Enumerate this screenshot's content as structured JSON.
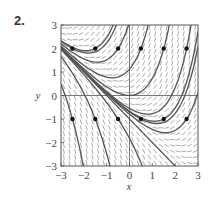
{
  "problem_number": "2.",
  "chart_data": {
    "type": "line",
    "subtype": "slope-field",
    "title": "",
    "xlabel": "x",
    "ylabel": "y",
    "xlim": [
      -3,
      3
    ],
    "ylim": [
      -3,
      3
    ],
    "xticks": [
      -3,
      -2,
      -1,
      0,
      1,
      2,
      3
    ],
    "yticks": [
      -3,
      -2,
      -1,
      0,
      1,
      2,
      3
    ],
    "xtick_labels": [
      "−3",
      "−2",
      "−1",
      "0",
      "1",
      "2",
      "3"
    ],
    "ytick_labels": [
      "−3",
      "−2",
      "−1",
      "0",
      "1",
      "2",
      "3"
    ],
    "grid": false,
    "slope_function": "x + y",
    "solution_family": "y = C e^x - x - 1",
    "initial_points": [
      {
        "x": -2.5,
        "y": 2
      },
      {
        "x": -1.5,
        "y": 2
      },
      {
        "x": -0.5,
        "y": 2
      },
      {
        "x": 0.5,
        "y": 2
      },
      {
        "x": 1.5,
        "y": 2
      },
      {
        "x": 2.5,
        "y": 2
      },
      {
        "x": -2.5,
        "y": -1
      },
      {
        "x": -1.5,
        "y": -1
      },
      {
        "x": -0.5,
        "y": -1
      },
      {
        "x": 0.5,
        "y": -1
      },
      {
        "x": 1.5,
        "y": -1
      },
      {
        "x": 2.5,
        "y": -1
      }
    ],
    "extra_solutions": [
      {
        "name": "linear-solution",
        "C": 0
      }
    ],
    "colors": {
      "field": "#8a8a8a",
      "curve": "#555555",
      "point": "#111111",
      "axis": "#555555"
    }
  }
}
